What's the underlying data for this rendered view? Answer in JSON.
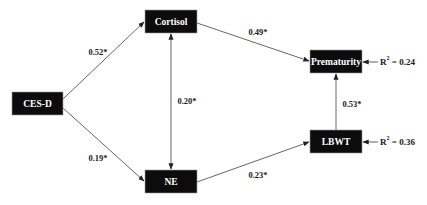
{
  "diagram": {
    "type": "path-model",
    "nodes": {
      "cesd": {
        "label": "CES-D"
      },
      "cortisol": {
        "label": "Cortisol"
      },
      "ne": {
        "label": "NE"
      },
      "prematurity": {
        "label": "Prematurity"
      },
      "lbwt": {
        "label": "LBWT"
      }
    },
    "edges": {
      "cesd_cortisol": {
        "from": "CES-D",
        "to": "Cortisol",
        "label": "0.52*"
      },
      "cesd_ne": {
        "from": "CES-D",
        "to": "NE",
        "label": "0.19*"
      },
      "cortisol_ne": {
        "from": "Cortisol",
        "to": "NE",
        "label": "0.20*",
        "bidirectional": true
      },
      "cortisol_prematurity": {
        "from": "Cortisol",
        "to": "Prematurity",
        "label": "0.49*"
      },
      "ne_lbwt": {
        "from": "NE",
        "to": "LBWT",
        "label": "0.23*"
      },
      "lbwt_prematurity": {
        "from": "LBWT",
        "to": "Prematurity",
        "label": "0.53*"
      }
    },
    "r_squared": {
      "prematurity": {
        "prefix": "R",
        "sup": "2",
        "value": " = 0.24"
      },
      "lbwt": {
        "prefix": "R",
        "sup": "2",
        "value": " = 0.36"
      }
    }
  }
}
